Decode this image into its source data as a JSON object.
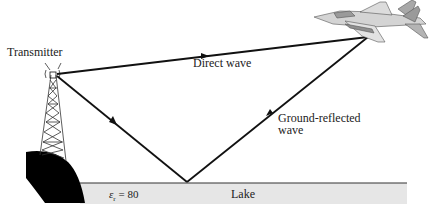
{
  "diagram": {
    "title": "",
    "labels": {
      "transmitter": "Transmitter",
      "direct_wave": "Direct wave",
      "ground_reflected_line1": "Ground-reflected",
      "ground_reflected_line2": "wave",
      "lake": "Lake",
      "permittivity_symbol": "ε",
      "permittivity_subscript": "r",
      "permittivity_value": " = 80"
    },
    "elements": [
      {
        "id": "transmitter-tower",
        "type": "lattice tower",
        "antenna_tip": [
          54,
          74
        ]
      },
      {
        "id": "aircraft",
        "type": "fighter jet",
        "position": [
          300,
          5
        ]
      },
      {
        "id": "direct-wave-path",
        "from": "transmitter",
        "to": "aircraft",
        "arrows": 1
      },
      {
        "id": "incident-wave-path",
        "from": "transmitter",
        "to": "reflection-point",
        "arrows": 1
      },
      {
        "id": "reflected-wave-path",
        "from": "reflection-point",
        "to": "aircraft",
        "arrows": 1
      },
      {
        "id": "lake-surface",
        "type": "water",
        "relative_permittivity": 80
      },
      {
        "id": "hill",
        "type": "ground"
      }
    ],
    "colors": {
      "line": "#111111",
      "lake_fill": "#e6e6e6",
      "hill": "#000000",
      "aircraft_light": "#d4d4d4",
      "aircraft_dark": "#9a9a9a"
    }
  }
}
